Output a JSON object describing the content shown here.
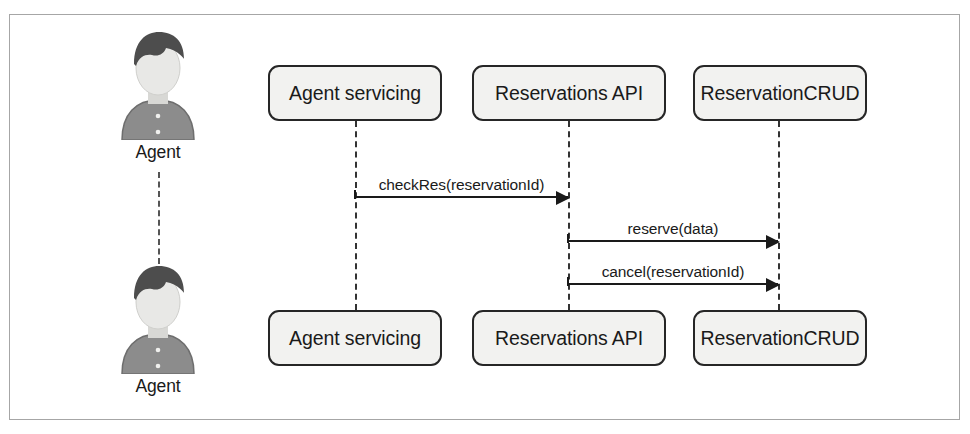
{
  "diagram": {
    "type": "uml-sequence-diagram",
    "frame": {
      "border_color": "#a6a6a6",
      "background": "#ffffff"
    },
    "colors": {
      "box_fill": "#f2f2f0",
      "box_border": "#262626",
      "line": "#1a1a1a",
      "actor_hair": "#4d4d4d",
      "actor_body": "#8c8c8c",
      "actor_face": "#e8e8e6"
    },
    "actors": [
      {
        "id": "actor-top",
        "label": "Agent",
        "icon": "person-icon"
      },
      {
        "id": "actor-bottom",
        "label": "Agent",
        "icon": "person-icon"
      }
    ],
    "participants_top": [
      {
        "id": "agent-servicing",
        "label": "Agent servicing"
      },
      {
        "id": "reservations-api",
        "label": "Reservations API"
      },
      {
        "id": "reservation-crud",
        "label": "ReservationCRUD"
      }
    ],
    "participants_bottom": [
      {
        "id": "agent-servicing",
        "label": "Agent servicing"
      },
      {
        "id": "reservations-api",
        "label": "Reservations API"
      },
      {
        "id": "reservation-crud",
        "label": "ReservationCRUD"
      }
    ],
    "messages": [
      {
        "id": "msg-1",
        "label": "checkRes(reservationId)",
        "from": "agent-servicing",
        "to": "reservations-api"
      },
      {
        "id": "msg-2",
        "label": "reserve(data)",
        "from": "reservations-api",
        "to": "reservation-crud"
      },
      {
        "id": "msg-3",
        "label": "cancel(reservationId)",
        "from": "reservations-api",
        "to": "reservation-crud"
      }
    ]
  }
}
